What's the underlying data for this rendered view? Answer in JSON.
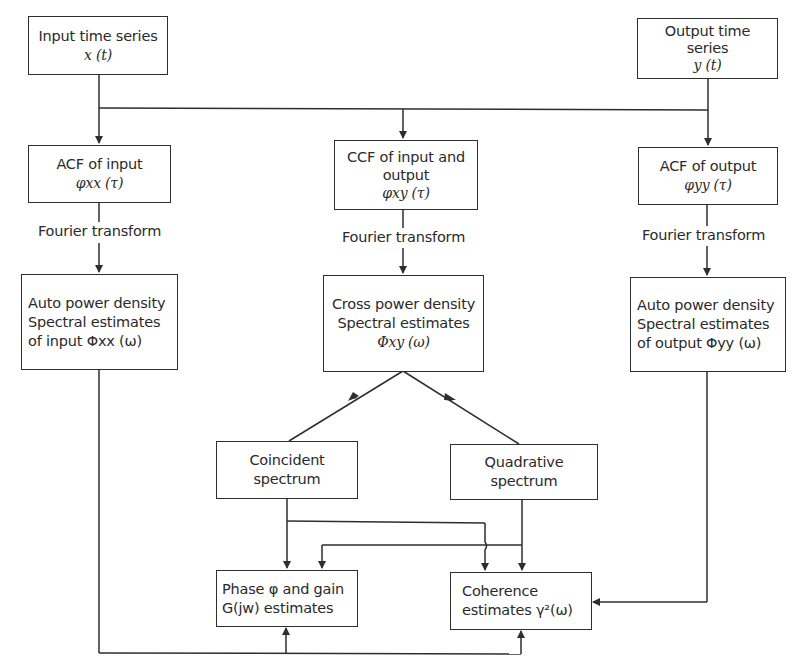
{
  "diagram": {
    "nodes": {
      "input_series": {
        "line1": "Input time series",
        "line2": "x (t)"
      },
      "output_series": {
        "line1": "Output time",
        "line2": "series",
        "line3": "y (t)"
      },
      "acf_input": {
        "line1": "ACF of input",
        "line2": "φxx (τ)"
      },
      "ccf": {
        "line1": "CCF of input and",
        "line2": "output",
        "line3": "φxy  (τ)"
      },
      "acf_output": {
        "line1": "ACF of output",
        "line2": "φyy (τ)"
      },
      "auto_power_input": {
        "line1": "Auto power density",
        "line2": "Spectral estimates",
        "line3": "of input Φxx (ω)"
      },
      "cross_power": {
        "line1": "Cross power density",
        "line2": "Spectral estimates",
        "line3": "Φxy  (ω)"
      },
      "auto_power_output": {
        "line1": "Auto power density",
        "line2": "Spectral estimates",
        "line3": "of output Φyy (ω)"
      },
      "coincident": {
        "line1": "Coincident",
        "line2": "spectrum"
      },
      "quadrative": {
        "line1": "Quadrative",
        "line2": "spectrum"
      },
      "phase_gain": {
        "line1": "Phase φ and gain",
        "line2": "G(jw)  estimates"
      },
      "coherence": {
        "line1": "Coherence",
        "line2": "estimates γ²(ω)"
      }
    },
    "edge_labels": {
      "fourier_left": "Fourier transform",
      "fourier_center": "Fourier transform",
      "fourier_right": "Fourier transform"
    },
    "colors": {
      "stroke": "#2e2e2e",
      "background": "#ffffff",
      "text": "#2a2a2a"
    }
  }
}
